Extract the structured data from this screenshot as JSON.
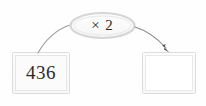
{
  "diagram": {
    "type": "function-machine",
    "input_box": {
      "name": "input-box",
      "value": "436",
      "fill": "#fbfbfb",
      "border": "#d8d8d8"
    },
    "operation_bubble": {
      "name": "operation-bubble",
      "label": "× 2",
      "fill": "#fbfbfb",
      "border": "#d5d5d5"
    },
    "output_box": {
      "name": "output-box",
      "value": "",
      "placeholder": "",
      "fill": "#ffffff",
      "border": "#d8d8d8"
    },
    "arrows": [
      {
        "name": "arrow-input-to-operation",
        "from": "input-box",
        "to": "operation-bubble",
        "has_arrowhead": false,
        "color": "#9a9a9a"
      },
      {
        "name": "arrow-operation-to-output",
        "from": "operation-bubble",
        "to": "output-box",
        "has_arrowhead": true,
        "color": "#6e6e6e"
      }
    ],
    "colors": {
      "background": "#fefefe",
      "text": "#2b2b2b",
      "stroke": "#9a9a9a",
      "arrowhead": "#555555"
    }
  }
}
